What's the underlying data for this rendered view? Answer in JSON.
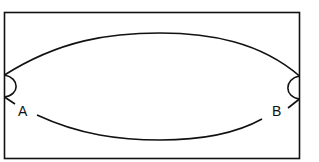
{
  "diagram": {
    "type": "line-drawing",
    "labels": {
      "a": "A",
      "b": "B"
    },
    "colors": {
      "stroke": "#111111",
      "background": "#ffffff"
    }
  }
}
